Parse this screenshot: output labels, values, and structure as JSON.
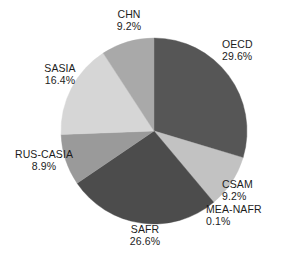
{
  "chart_data": {
    "type": "pie",
    "title": "",
    "subtitle": "",
    "xlabel": "",
    "ylabel": "",
    "legend_position": "none",
    "grid": false,
    "labels_outside": true,
    "start_angle_deg": 0,
    "direction": "clockwise",
    "categories": [
      "OECD",
      "MEA-NAFR",
      "CSAM",
      "SAFR",
      "RUS-CASIA",
      "SASIA",
      "CHN"
    ],
    "values": [
      29.6,
      0.1,
      9.2,
      26.6,
      8.9,
      16.4,
      9.2
    ],
    "value_suffix": "%",
    "slices": [
      {
        "name": "OECD",
        "value": 29.6,
        "value_label": "29.6%",
        "color": "#565656"
      },
      {
        "name": "MEA-NAFR",
        "value": 0.1,
        "value_label": "0.1%",
        "color": "#7d7d7d"
      },
      {
        "name": "CSAM",
        "value": 9.2,
        "value_label": "9.2%",
        "color": "#c2c2c2"
      },
      {
        "name": "SAFR",
        "value": 26.6,
        "value_label": "26.6%",
        "color": "#4c4c4c"
      },
      {
        "name": "RUS-CASIA",
        "value": 8.9,
        "value_label": "8.9%",
        "color": "#9a9a9a"
      },
      {
        "name": "SASIA",
        "value": 16.4,
        "value_label": "16.4%",
        "color": "#d6d6d6"
      },
      {
        "name": "CHN",
        "value": 9.2,
        "value_label": "9.2%",
        "color": "#a9a9a9"
      }
    ],
    "geometry": {
      "center_x": 154,
      "center_y": 131,
      "radius": 93
    },
    "background_color": "#ffffff",
    "text_color": "#1c1c1c"
  }
}
